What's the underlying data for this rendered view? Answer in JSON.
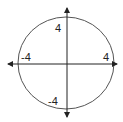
{
  "diagram": {
    "type": "circle-on-axes",
    "circle": {
      "center": [
        0,
        0
      ],
      "radius": 4
    },
    "labels": {
      "y_top": "4",
      "y_bottom": "-4",
      "x_left": "-4",
      "x_right": "4"
    },
    "colors": {
      "stroke": "#444444",
      "text": "#222222",
      "background": "#ffffff"
    }
  }
}
